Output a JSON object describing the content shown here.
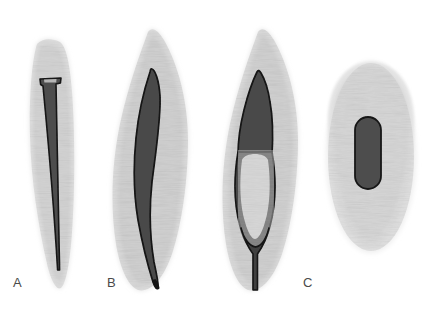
{
  "figure": {
    "background_color": "#ffffff",
    "width": 435,
    "height": 309,
    "colors": {
      "tooth_body": "#d6d6d6",
      "tooth_body_light": "#e9e9e9",
      "canal_fill": "#4c4c4c",
      "canal_outline": "#1a1a1a",
      "label_text": "#4a4a4a",
      "background": "#ffffff"
    },
    "texture": {
      "name": "wavy-speckle-texture",
      "description": "fine wavy grain overlay on tooth body",
      "opacity": 0.18
    }
  },
  "panels": [
    {
      "id": "panel-a",
      "label": "A",
      "view": "longitudinal",
      "canal_type": "single tapering canal",
      "canal_count": 1,
      "root_shape": "straight narrow root",
      "label_position": {
        "x": 13,
        "y": 276
      }
    },
    {
      "id": "panel-b",
      "label": "B",
      "view": "longitudinal",
      "canal_type": "single wide oval canal with curved apex",
      "canal_count": 1,
      "root_shape": "flame shaped root with apical curve",
      "label_position": {
        "x": 107,
        "y": 276
      }
    },
    {
      "id": "panel-b2",
      "label": "",
      "view": "longitudinal",
      "canal_type": "bifurcated canal rejoining apically",
      "canal_count": 2,
      "root_shape": "flame shaped root with central island",
      "label_position": {
        "x": 0,
        "y": 0
      }
    },
    {
      "id": "panel-c",
      "label": "C",
      "view": "cross-section",
      "canal_type": "single oval canal in cross section",
      "canal_count": 1,
      "root_shape": "ovoid cross section",
      "label_position": {
        "x": 303,
        "y": 276
      }
    }
  ]
}
